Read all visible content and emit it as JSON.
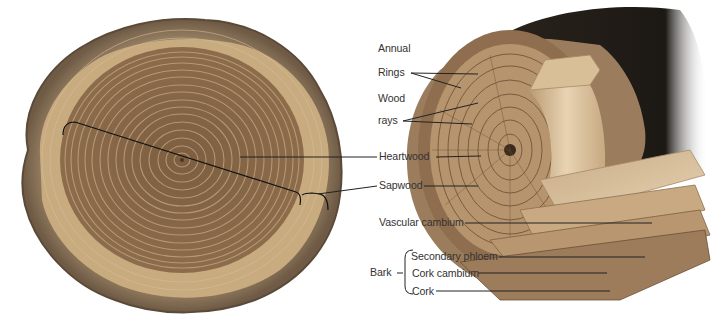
{
  "diagram": {
    "left_figure": "tree trunk cross-section slice",
    "right_figure": "cutaway of log showing layers",
    "labels": {
      "annual_rings_line1": "Annual",
      "annual_rings_line2": "Rings",
      "wood_rays_line1": "Wood",
      "wood_rays_line2": "rays",
      "heartwood": "Heartwood",
      "sapwood": "Sapwood",
      "vascular_cambium": "Vascular cambium",
      "bark": "Bark",
      "secondary_phloem": "Secondary phloem",
      "cork_cambium": "Cork cambium",
      "cork": "Cork"
    },
    "colors": {
      "heartwood": "#8a6a4a",
      "sapwood": "#c9ab80",
      "bark": "#6e5a45",
      "outer_bark_dark": "#1e1a16",
      "label_text": "#333333",
      "leader_line": "#222222"
    }
  }
}
